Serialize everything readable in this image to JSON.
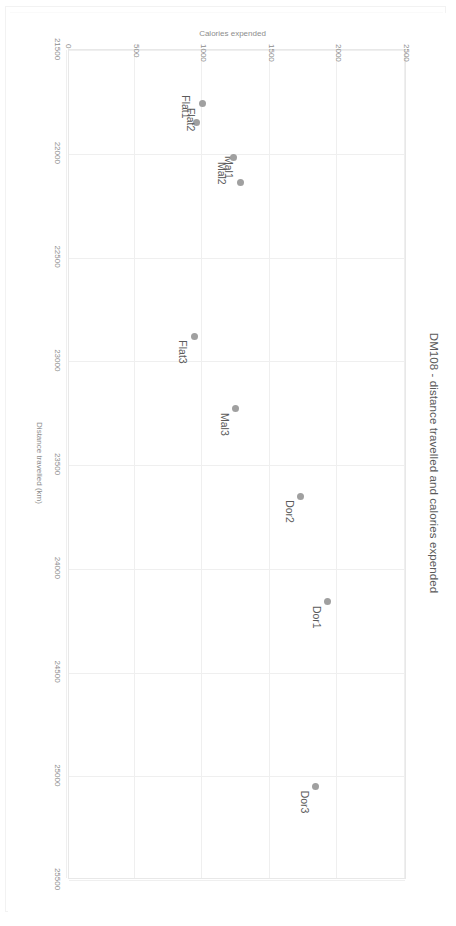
{
  "chart_data": {
    "type": "scatter",
    "title": "DM108 - distance travelled and calories expended",
    "xlabel": "Distance travelled (km)",
    "ylabel": "Calories expended",
    "xlim": [
      21500,
      25500
    ],
    "ylim": [
      0,
      2500
    ],
    "xticks": [
      21500,
      22000,
      22500,
      23000,
      23500,
      24000,
      24500,
      25000,
      25500
    ],
    "yticks": [
      0,
      500,
      1000,
      1500,
      2000,
      2500
    ],
    "xtick_labels": [
      "21500",
      "22000",
      "22500",
      "23000",
      "23500",
      "24000",
      "24500",
      "25000",
      "25500"
    ],
    "ytick_labels": [
      "0",
      "500",
      "1000",
      "1500",
      "2000",
      "2500"
    ],
    "grid": true,
    "legend": "none",
    "marker_color": "#a0a0a0",
    "points": [
      {
        "label": "Flat1",
        "x": 21850,
        "y": 960,
        "label_pos": "left"
      },
      {
        "label": "Flat2",
        "x": 21760,
        "y": 1000,
        "label_pos": "right"
      },
      {
        "label": "Mal1",
        "x": 22140,
        "y": 1280,
        "label_pos": "left"
      },
      {
        "label": "Mal2",
        "x": 22020,
        "y": 1230,
        "label_pos": "right"
      },
      {
        "label": "Flat3",
        "x": 22880,
        "y": 940,
        "label_pos": "right"
      },
      {
        "label": "Mal3",
        "x": 23230,
        "y": 1250,
        "label_pos": "right"
      },
      {
        "label": "Dor2",
        "x": 23650,
        "y": 1730,
        "label_pos": "right"
      },
      {
        "label": "Dor1",
        "x": 24160,
        "y": 1930,
        "label_pos": "right"
      },
      {
        "label": "Dor3",
        "x": 25050,
        "y": 1840,
        "label_pos": "right"
      }
    ]
  }
}
